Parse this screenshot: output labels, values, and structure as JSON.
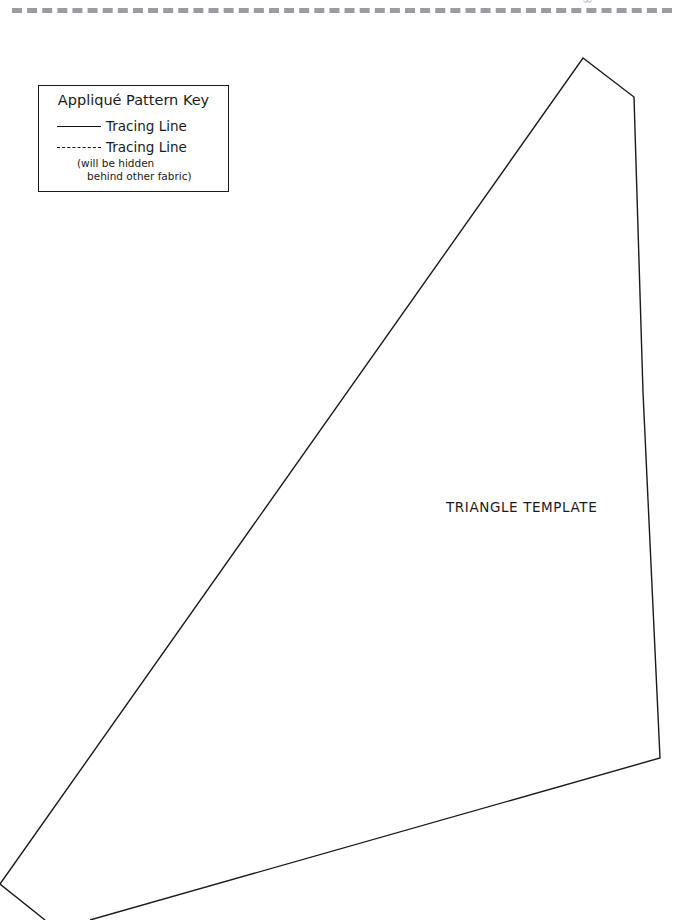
{
  "page": {
    "background_color": "#ffffff",
    "width": 690,
    "height": 920
  },
  "cut_line": {
    "style": "dashed",
    "color": "#9b9ba3",
    "name": "page-cut-line"
  },
  "page_artifact": {
    "text": "∞"
  },
  "legend": {
    "title": "Appliqué Pattern Key",
    "border_color": "#1a1a1a",
    "entries": [
      {
        "line_style": "solid",
        "label": "Tracing Line",
        "note": "",
        "note_line2": ""
      },
      {
        "line_style": "dashed",
        "label": "Tracing Line",
        "note": "(will be hidden",
        "note_line2": "behind other fabric)"
      }
    ]
  },
  "template_shape": {
    "label": "TRIANGLE TEMPLATE",
    "stroke_color": "#1a1a1a",
    "stroke_width": 1.4,
    "fill": "none",
    "outline_points": "0,884 583,58 634,97 643,392 660,758 90,920 45,920",
    "vertices": [
      {
        "name": "left-point",
        "x": 0,
        "y": 884
      },
      {
        "name": "apex",
        "x": 583,
        "y": 58
      },
      {
        "name": "upper-right-notch",
        "x": 634,
        "y": 97
      },
      {
        "name": "right-mid",
        "x": 643,
        "y": 392
      },
      {
        "name": "lower-right",
        "x": 660,
        "y": 758
      },
      {
        "name": "bottom-edge-exit",
        "x": 90,
        "y": 920
      },
      {
        "name": "left-tail-exit",
        "x": 45,
        "y": 920
      }
    ]
  }
}
